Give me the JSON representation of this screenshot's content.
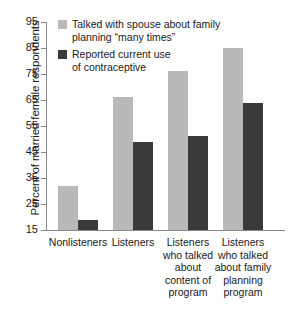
{
  "chart_data": {
    "type": "bar",
    "title": "",
    "xlabel": "",
    "ylabel": "Percent of married female respondents",
    "ylim": [
      15,
      95
    ],
    "yticks": [
      "15",
      "25",
      "35",
      "45",
      "55",
      "65",
      "75",
      "85",
      "95"
    ],
    "grid": false,
    "legend_position": "top-left",
    "categories": [
      "Nonlisteners",
      "Listeners",
      "Listeners who talked about content of program",
      "Listeners who talked about family planning program"
    ],
    "category_lines": [
      [
        "Nonlisteners"
      ],
      [
        "Listeners"
      ],
      [
        "Listeners",
        "who talked",
        "about",
        "content of",
        "program"
      ],
      [
        "Listeners",
        "who talked",
        "about family",
        "planning",
        "program"
      ]
    ],
    "series": [
      {
        "name": "Talked with spouse about family planning “many times”",
        "color": "#b9b9b9",
        "values": [
          32,
          66,
          76,
          85
        ]
      },
      {
        "name": "Reported current use of contraceptive",
        "color": "#3a3a3a",
        "values": [
          19,
          49,
          51,
          64
        ]
      }
    ]
  },
  "legend": {
    "items": [
      {
        "line1": "Talked with spouse about family",
        "line2": "planning “many times”"
      },
      {
        "line1": "Reported current use",
        "line2": "of contraceptive"
      }
    ]
  },
  "axis": {
    "y_title": "Percent of married female respondents"
  },
  "colors": {
    "light_series": "#b9b9b9",
    "dark_series": "#3a3a3a",
    "axis": "#8a8a8a",
    "text": "#1a1a1a",
    "background": "#ffffff"
  }
}
